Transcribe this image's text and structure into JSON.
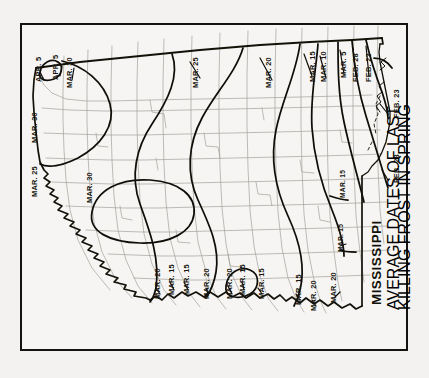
{
  "page": {
    "background_color": "#f3f2f0",
    "plate_border_color": "#15130f"
  },
  "title_block": {
    "state": "MISSISSIPPI",
    "subtitle_line1": "AVERAGE DATES OF LAST",
    "subtitle_line2": "KILLING FROST IN SPRING"
  },
  "map": {
    "orientation_note": "map rotated 90 degrees clockwise; north is to the right",
    "state_outline_color": "#121009",
    "county_line_color": "#9b9992",
    "isoline_color": "#100e08"
  },
  "chart_data": {
    "type": "map",
    "title": "MISSISSIPPI",
    "subtitle": "AVERAGE DATES OF LAST KILLING FROST IN SPRING",
    "variable": "average date of last killing frost in spring",
    "contour_unit": "calendar date",
    "contour_levels": [
      "APR. 5",
      "MAR. 30",
      "MAR. 25",
      "MAR. 20",
      "MAR. 15",
      "MAR. 10",
      "MAR. 5",
      "FEB. 28",
      "FEB. 23"
    ],
    "gradient_description": "latest frost dates (APR. 5 / MAR. 30) in the north-west of the state, earliest dates (FEB. 23) along the Gulf coast in the south-east"
  },
  "labels": [
    {
      "id": "l01",
      "text": "APR. 5",
      "x": 35,
      "y": 82,
      "size": "normal"
    },
    {
      "id": "l02",
      "text": "APR. 5",
      "x": 52,
      "y": 80,
      "size": "normal"
    },
    {
      "id": "l03",
      "text": "MAR. 30",
      "x": 66,
      "y": 88,
      "size": "normal"
    },
    {
      "id": "l04",
      "text": "MAR. 30",
      "x": 31,
      "y": 143,
      "size": "normal"
    },
    {
      "id": "l05",
      "text": "MAR. 25",
      "x": 31,
      "y": 197,
      "size": "normal"
    },
    {
      "id": "l06",
      "text": "MAR. 30",
      "x": 86,
      "y": 203,
      "size": "normal"
    },
    {
      "id": "l07",
      "text": "MAR. 25",
      "x": 192,
      "y": 88,
      "size": "normal"
    },
    {
      "id": "l08",
      "text": "MAR. 20",
      "x": 265,
      "y": 88,
      "size": "normal"
    },
    {
      "id": "l09",
      "text": "MAR. 15",
      "x": 309,
      "y": 82,
      "size": "normal"
    },
    {
      "id": "l10",
      "text": "MAR. 10",
      "x": 320,
      "y": 82,
      "size": "normal"
    },
    {
      "id": "l11",
      "text": "MAR. 5",
      "x": 340,
      "y": 78,
      "size": "normal"
    },
    {
      "id": "l12",
      "text": "FEB. 28",
      "x": 352,
      "y": 82,
      "size": "normal"
    },
    {
      "id": "l13",
      "text": "FEB. 23",
      "x": 365,
      "y": 82,
      "size": "normal"
    },
    {
      "id": "l14",
      "text": "FEB. 23",
      "x": 393,
      "y": 118,
      "size": "normal"
    },
    {
      "id": "l15",
      "text": "FEB. 28",
      "x": 393,
      "y": 183,
      "size": "normal"
    },
    {
      "id": "l16",
      "text": "MAR. 20",
      "x": 154,
      "y": 299,
      "size": "normal"
    },
    {
      "id": "l17",
      "text": "MAR. 15",
      "x": 168,
      "y": 295,
      "size": "normal"
    },
    {
      "id": "l18",
      "text": "MAR. 15",
      "x": 183,
      "y": 295,
      "size": "normal"
    },
    {
      "id": "l19",
      "text": "MAR. 20",
      "x": 203,
      "y": 299,
      "size": "normal"
    },
    {
      "id": "l20",
      "text": "MAR. 20",
      "x": 226,
      "y": 299,
      "size": "normal"
    },
    {
      "id": "l21",
      "text": "MAR. 15",
      "x": 239,
      "y": 295,
      "size": "normal"
    },
    {
      "id": "l22",
      "text": "MAR. 15",
      "x": 258,
      "y": 299,
      "size": "normal"
    },
    {
      "id": "l23",
      "text": "MAR. 15",
      "x": 295,
      "y": 305,
      "size": "normal"
    },
    {
      "id": "l24",
      "text": "MAR. 20",
      "x": 310,
      "y": 311,
      "size": "normal"
    },
    {
      "id": "l25",
      "text": "MAR. 20",
      "x": 330,
      "y": 303,
      "size": "normal"
    },
    {
      "id": "l26",
      "text": "MAR. 15",
      "x": 338,
      "y": 252,
      "size": "small"
    },
    {
      "id": "l27",
      "text": "MAR. 15",
      "x": 340,
      "y": 198,
      "size": "small"
    }
  ]
}
